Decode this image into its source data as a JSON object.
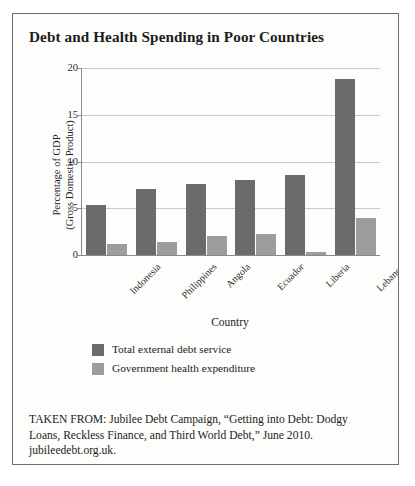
{
  "figure": {
    "title": "Debt and Health Spending in Poor Countries",
    "source": "TAKEN FROM: Jubilee Debt Campaign, “Getting into Debt: Dodgy Loans, Reckless Finance, and Third World Debt,” June 2010. jubileedebt.org.uk."
  },
  "chart_data": {
    "type": "bar",
    "title": "Debt and Health Spending in Poor Countries",
    "categories": [
      "Indonesia",
      "Philippines",
      "Angola",
      "Ecuador",
      "Liberia",
      "Lebanon"
    ],
    "series": [
      {
        "name": "Total external debt service",
        "color": "#6b6b6b",
        "values": [
          5.4,
          7.1,
          7.6,
          8.0,
          8.6,
          18.8
        ]
      },
      {
        "name": "Government health expenditure",
        "color": "#9d9d9d",
        "values": [
          1.2,
          1.35,
          2.0,
          2.3,
          0.3,
          4.0
        ]
      }
    ],
    "xlabel": "Country",
    "ylabel_line1": "Percentage of GDP",
    "ylabel_line2": "(Gross Domestic Product)",
    "ylim": [
      0,
      20
    ],
    "yticks": [
      0,
      5,
      10,
      15,
      20
    ],
    "grid": true,
    "legend_position": "below-plot-left",
    "xtick_rotation": -45
  }
}
